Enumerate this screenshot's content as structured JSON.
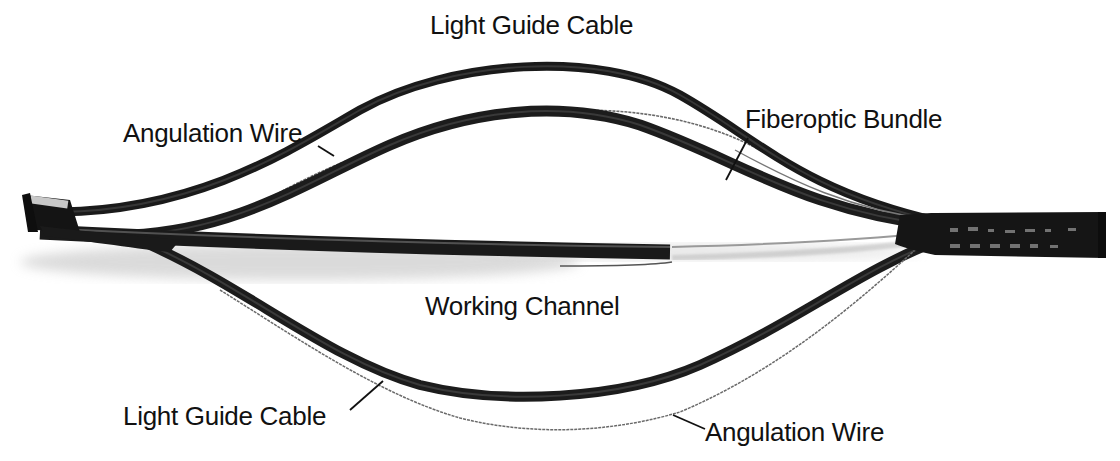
{
  "figure": {
    "labels": {
      "light_guide_cable_top": "Light Guide Cable",
      "angulation_wire_top": "Angulation Wire",
      "fiberoptic_bundle": "Fiberoptic Bundle",
      "working_channel": "Working Channel",
      "light_guide_cable_bottom": "Light Guide Cable",
      "angulation_wire_bottom": "Angulation Wire"
    },
    "colors": {
      "background": "#ffffff",
      "cable": "#1a1a1a",
      "wire": "#555555",
      "text": "#111111"
    }
  }
}
